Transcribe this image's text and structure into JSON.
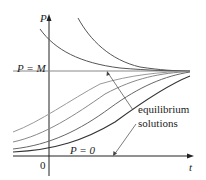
{
  "diagram": {
    "y_axis_label": "P",
    "x_axis_label": "t",
    "origin_label": "0",
    "upper_equilibrium_label": "P = M",
    "lower_equilibrium_label": "P = 0",
    "annotation_line1": "equilibrium",
    "annotation_line2": "solutions",
    "colors": {
      "axis": "#222222",
      "equilibrium_line": "#888888",
      "curve_dark": "#333333",
      "curve_light": "#999999",
      "text": "#222222"
    }
  }
}
